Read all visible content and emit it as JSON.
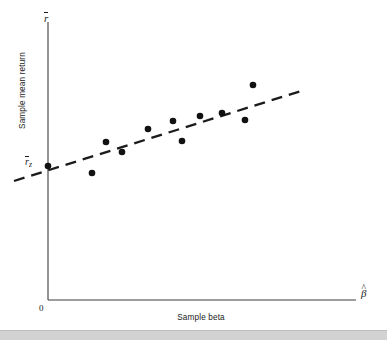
{
  "figure": {
    "name": "sample-mean-return-vs-sample-beta-scatter",
    "background_color": "#ffffff",
    "bottom_strip_color": "#d2d2d2"
  },
  "axes": {
    "y_axis_symbol_base": "r",
    "y_axis_symbol_display": "r̄",
    "y_axis_title": "Sample mean return",
    "x_axis_symbol_base": "β",
    "x_axis_symbol_display": "β̂",
    "x_axis_title": "Sample beta",
    "origin_label": "0",
    "intercept_label_base": "r",
    "intercept_label_subscript": "z",
    "intercept_label_display": "r̄z",
    "axis_color": "#3c3c3c"
  },
  "chart_data": {
    "type": "scatter",
    "title": "",
    "subtitle": "",
    "xlabel": "Sample beta",
    "ylabel": "Sample mean return",
    "xlim": [
      0,
      1.0
    ],
    "ylim": [
      0,
      1.0
    ],
    "grid": false,
    "legend": "none",
    "point_color": "#111111",
    "point_radius_px": 3.3,
    "series": [
      {
        "name": "Portfolio sample observations",
        "marker": "filled-circle",
        "points": [
          {
            "px": 48,
            "py": 166,
            "label": "zero-beta intercept point"
          },
          {
            "px": 92,
            "py": 173,
            "label": "point-1"
          },
          {
            "px": 106,
            "py": 142,
            "label": "point-2"
          },
          {
            "px": 122,
            "py": 152,
            "label": "point-3"
          },
          {
            "px": 148,
            "py": 129,
            "label": "point-4"
          },
          {
            "px": 173,
            "py": 121,
            "label": "point-5"
          },
          {
            "px": 182,
            "py": 141,
            "label": "point-6"
          },
          {
            "px": 200,
            "py": 116,
            "label": "point-7"
          },
          {
            "px": 222,
            "py": 113,
            "label": "point-8"
          },
          {
            "px": 245,
            "py": 120,
            "label": "point-9"
          },
          {
            "px": 253,
            "py": 85,
            "label": "point-10"
          }
        ]
      }
    ],
    "fit_line": {
      "name": "fitted empirical security market line",
      "style": "dashed",
      "dash_pattern": "11 7",
      "color": "#1b1b1b",
      "width_px": 2.3,
      "x1_px": 14,
      "y1_px": 181,
      "x2_px": 301,
      "y2_px": 91,
      "slope_sign": "positive",
      "intercept_note": "intersects y-axis at r̄z, above the origin"
    },
    "annotations": [
      {
        "text": "r̄z",
        "role": "y-intercept marker",
        "px": 33,
        "py": 166
      },
      {
        "text": "0",
        "role": "origin",
        "px": 42,
        "py": 308
      },
      {
        "text": "r̄",
        "role": "y-axis variable symbol",
        "px": 47,
        "py": 18
      },
      {
        "text": "β̂",
        "role": "x-axis variable symbol",
        "px": 366,
        "py": 293
      }
    ]
  },
  "geometry": {
    "y_axis_x": 48,
    "y_axis_top": 22,
    "y_axis_bottom": 300,
    "x_axis_y": 300,
    "x_axis_left": 48,
    "x_axis_right": 356
  }
}
